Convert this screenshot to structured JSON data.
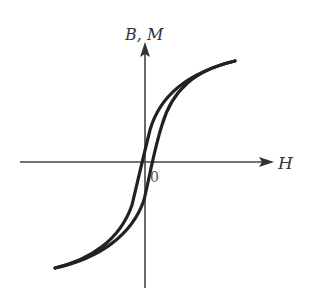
{
  "diagram": {
    "axes": {
      "x_label": "H",
      "y_label": "B, M",
      "origin_label": "0"
    },
    "colors": {
      "axis": "#444444",
      "curve": "#222222",
      "background": "#ffffff"
    },
    "curves": [
      {
        "name": "ascending-branch"
      },
      {
        "name": "descending-branch"
      }
    ]
  }
}
